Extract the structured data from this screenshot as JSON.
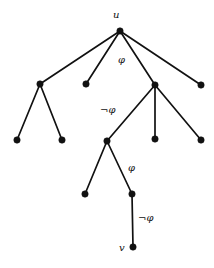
{
  "figure": {
    "name": "tree-graph-with-formula-edge-labels",
    "width": 214,
    "height": 268,
    "background_color": "#ffffff",
    "ink_color": "#111111"
  },
  "graph": {
    "type": "tree",
    "node_radius": 3.2,
    "edge_width": 1.7,
    "nodes": [
      {
        "id": "u",
        "x": 120,
        "y": 31,
        "label": "u",
        "label_x": 113,
        "label_y": 10,
        "has_label": true
      },
      {
        "id": "a1",
        "x": 40,
        "y": 84,
        "label": "",
        "label_x": 0,
        "label_y": 0,
        "has_label": false
      },
      {
        "id": "a2",
        "x": 86,
        "y": 84,
        "label": "",
        "label_x": 0,
        "label_y": 0,
        "has_label": false
      },
      {
        "id": "a3",
        "x": 155,
        "y": 85,
        "label": "",
        "label_x": 0,
        "label_y": 0,
        "has_label": false
      },
      {
        "id": "a4",
        "x": 201,
        "y": 85,
        "label": "",
        "label_x": 0,
        "label_y": 0,
        "has_label": false
      },
      {
        "id": "b1",
        "x": 17,
        "y": 140,
        "label": "",
        "label_x": 0,
        "label_y": 0,
        "has_label": false
      },
      {
        "id": "b2",
        "x": 62,
        "y": 140,
        "label": "",
        "label_x": 0,
        "label_y": 0,
        "has_label": false
      },
      {
        "id": "b3",
        "x": 107,
        "y": 141,
        "label": "",
        "label_x": 0,
        "label_y": 0,
        "has_label": false
      },
      {
        "id": "b4",
        "x": 155,
        "y": 139,
        "label": "",
        "label_x": 0,
        "label_y": 0,
        "has_label": false
      },
      {
        "id": "b5",
        "x": 201,
        "y": 140,
        "label": "",
        "label_x": 0,
        "label_y": 0,
        "has_label": false
      },
      {
        "id": "c1",
        "x": 85,
        "y": 194,
        "label": "",
        "label_x": 0,
        "label_y": 0,
        "has_label": false
      },
      {
        "id": "c2",
        "x": 132,
        "y": 194,
        "label": "",
        "label_x": 0,
        "label_y": 0,
        "has_label": false
      },
      {
        "id": "v",
        "x": 133,
        "y": 247,
        "label": "v",
        "label_x": 119,
        "label_y": 243,
        "has_label": true
      }
    ],
    "edges": [
      {
        "from": "u",
        "to": "a1",
        "label": "",
        "label_x": 0,
        "label_y": 0
      },
      {
        "from": "u",
        "to": "a2",
        "label": "",
        "label_x": 0,
        "label_y": 0
      },
      {
        "from": "u",
        "to": "a3",
        "label": "φ",
        "label_x": 118,
        "label_y": 55
      },
      {
        "from": "u",
        "to": "a4",
        "label": "",
        "label_x": 0,
        "label_y": 0
      },
      {
        "from": "a1",
        "to": "b1",
        "label": "",
        "label_x": 0,
        "label_y": 0
      },
      {
        "from": "a1",
        "to": "b2",
        "label": "",
        "label_x": 0,
        "label_y": 0
      },
      {
        "from": "a3",
        "to": "b3",
        "label": "¬φ",
        "label_x": 100,
        "label_y": 105
      },
      {
        "from": "a3",
        "to": "b4",
        "label": "",
        "label_x": 0,
        "label_y": 0
      },
      {
        "from": "a3",
        "to": "b5",
        "label": "",
        "label_x": 0,
        "label_y": 0
      },
      {
        "from": "b3",
        "to": "c1",
        "label": "",
        "label_x": 0,
        "label_y": 0
      },
      {
        "from": "b3",
        "to": "c2",
        "label": "φ",
        "label_x": 128,
        "label_y": 163
      },
      {
        "from": "c2",
        "to": "v",
        "label": "¬φ",
        "label_x": 138,
        "label_y": 213
      }
    ]
  },
  "labels": {
    "root": "u",
    "target": "v",
    "formula": "φ",
    "negated_formula": "¬φ"
  }
}
